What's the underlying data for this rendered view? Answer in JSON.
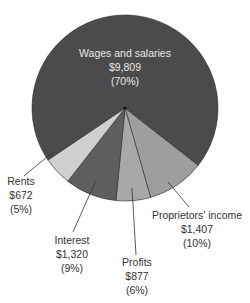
{
  "chart_data": {
    "type": "pie",
    "title": "",
    "center": [
      125,
      108
    ],
    "radius": 93,
    "start_angle_deg": 38,
    "slices": [
      {
        "key": "proprietors",
        "label": "Proprietors' income",
        "value_label": "$1,407",
        "pct_label": "(10%)",
        "value": 1407,
        "percent": 10,
        "color": "#9e9e9e"
      },
      {
        "key": "profits",
        "label": "Profits",
        "value_label": "$877",
        "pct_label": "(6%)",
        "value": 877,
        "percent": 6,
        "color": "#a8a8a8"
      },
      {
        "key": "interest",
        "label": "Interest",
        "value_label": "$1,320",
        "pct_label": "(9%)",
        "value": 1320,
        "percent": 9,
        "color": "#5e5e5e"
      },
      {
        "key": "rents",
        "label": "Rents",
        "value_label": "$672",
        "pct_label": "(5%)",
        "value": 672,
        "percent": 5,
        "color": "#cfcfcf"
      },
      {
        "key": "wages",
        "label": "Wages and salaries",
        "value_label": "$9,809",
        "pct_label": "(70%)",
        "value": 9809,
        "percent": 70,
        "color": "#4b4b4b"
      }
    ],
    "labels": {
      "wages": {
        "x": 125,
        "y": 57,
        "inside": true
      },
      "rents": {
        "x": 21,
        "y": 182,
        "leader": [
          [
            24,
            176
          ],
          [
            53,
            152
          ]
        ]
      },
      "interest": {
        "x": 72,
        "y": 244,
        "leader": [
          [
            73,
            232
          ],
          [
            96,
            180
          ]
        ]
      },
      "profits": {
        "x": 137,
        "y": 267,
        "leader": [
          [
            136,
            255
          ],
          [
            132,
            188
          ]
        ]
      },
      "proprietors": {
        "x": 195,
        "y": 219,
        "leader": [
          [
            189,
            207
          ],
          [
            168,
            182
          ]
        ]
      }
    }
  }
}
